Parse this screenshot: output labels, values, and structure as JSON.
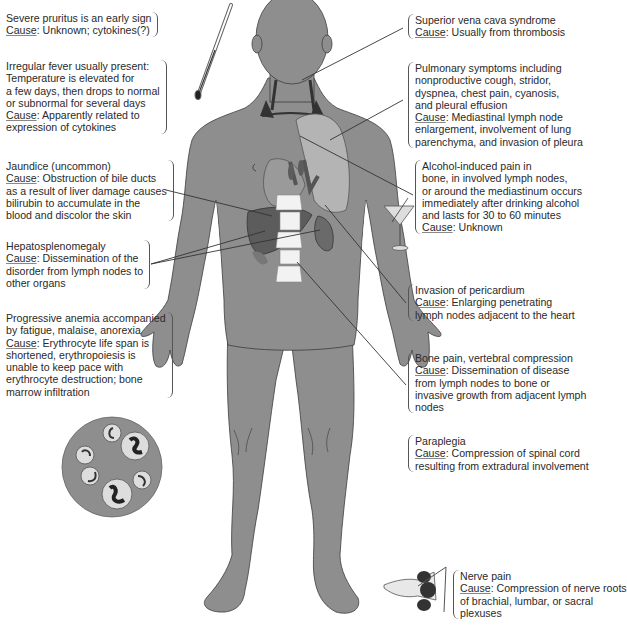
{
  "figure": {
    "colors": {
      "body": "#8e8e8e",
      "body_outline": "#3c3c3c",
      "organ_dark": "#5c5c5c",
      "organ_light": "#b4b4b4",
      "bone": "#f2f2f2",
      "text": "#2a2a2a",
      "leader": "#333333"
    }
  },
  "cause_label": "Cause",
  "annotations": {
    "pruritus": {
      "symptom": [
        "Severe pruritus is an early sign"
      ],
      "cause": [
        "Unknown; cytokines(?)"
      ]
    },
    "fever": {
      "symptom": [
        "Irregular fever usually present:",
        "Temperature is elevated for",
        "a few days, then drops to normal",
        "or subnormal for several days"
      ],
      "cause": [
        "Apparently related to",
        "expression of cytokines"
      ]
    },
    "jaundice": {
      "symptom": [
        "Jaundice (uncommon)"
      ],
      "cause": [
        "Obstruction of bile ducts",
        "as a result of liver damage causes",
        "bilirubin to accumulate in the",
        "blood and discolor the skin"
      ]
    },
    "hepatosplenomegaly": {
      "symptom": [
        "Hepatosplenomegaly"
      ],
      "cause": [
        "Dissemination of the",
        "disorder from lymph nodes to",
        "other organs"
      ]
    },
    "anemia": {
      "symptom": [
        "Progressive anemia accompanied",
        "by fatigue, malaise, anorexia"
      ],
      "cause": [
        "Erythrocyte life span is",
        "shortened, erythropoiesis is",
        "unable to keep pace with",
        "erythrocyte destruction; bone",
        "marrow infiltration"
      ]
    },
    "svc": {
      "symptom": [
        "Superior vena cava syndrome"
      ],
      "cause": [
        "Usually from thrombosis"
      ]
    },
    "pulmonary": {
      "symptom": [
        "Pulmonary symptoms including",
        "nonproductive cough, stridor,",
        "dyspnea, chest pain, cyanosis,",
        "and pleural effusion"
      ],
      "cause": [
        "Mediastinal lymph node",
        "enlargement, involvement of lung",
        "parenchyma, and invasion of pleura"
      ]
    },
    "alcohol": {
      "symptom": [
        "Alcohol-induced pain in",
        "bone, in involved lymph nodes,",
        "or around the mediastinum occurs",
        "immediately after drinking alcohol",
        "and lasts for 30 to 60 minutes"
      ],
      "cause": [
        "Unknown"
      ]
    },
    "pericardium": {
      "symptom": [
        "Invasion of pericardium"
      ],
      "cause": [
        "Enlarging penetrating",
        "lymph nodes adjacent to the heart"
      ]
    },
    "bone": {
      "symptom": [
        "Bone pain, vertebral compression"
      ],
      "cause": [
        "Dissemination of disease",
        "from lymph nodes to bone or",
        "invasive growth from adjacent lymph",
        "nodes"
      ]
    },
    "paraplegia": {
      "symptom": [
        "Paraplegia"
      ],
      "cause": [
        "Compression of spinal cord",
        "resulting from extradural involvement"
      ]
    },
    "nerve": {
      "symptom": [
        "Nerve pain"
      ],
      "cause": [
        "Compression of nerve roots",
        "of brachial, lumbar, or sacral",
        "plexuses"
      ]
    }
  },
  "illustrations": [
    {
      "name": "thermometer",
      "icon": "thermometer-icon"
    },
    {
      "name": "martini-glass",
      "icon": "martini-glass-icon"
    },
    {
      "name": "blood-smear",
      "icon": "blood-cells-icon",
      "cell_count": 6
    },
    {
      "name": "nerve-plexus",
      "icon": "nerve-root-icon"
    }
  ]
}
